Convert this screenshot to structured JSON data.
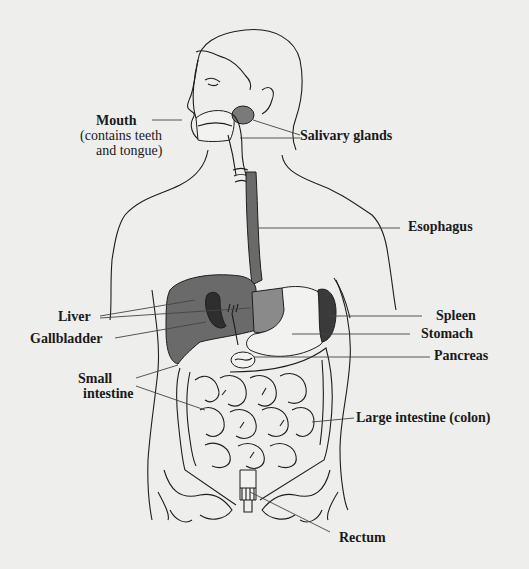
{
  "diagram": {
    "colors": {
      "background": "#eeeeec",
      "line": "#1e1e1e",
      "liver": "#6a6a6a",
      "esophagus": "#6a6a6a",
      "gallbladder": "#2e2e2e",
      "spleen": "#3a3a3a",
      "salivary_gland": "#7a7a7a",
      "stomach_top": "#8a8a8a"
    },
    "labels": {
      "mouth": "Mouth",
      "mouth_note_1": "(contains teeth",
      "mouth_note_2": "and tongue)",
      "salivary_glands": "Salivary glands",
      "esophagus": "Esophagus",
      "liver": "Liver",
      "gallbladder": "Gallbladder",
      "spleen": "Spleen",
      "stomach": "Stomach",
      "pancreas": "Pancreas",
      "small_intestine_1": "Small",
      "small_intestine_2": "intestine",
      "large_intestine": "Large intestine (colon)",
      "rectum": "Rectum"
    }
  }
}
